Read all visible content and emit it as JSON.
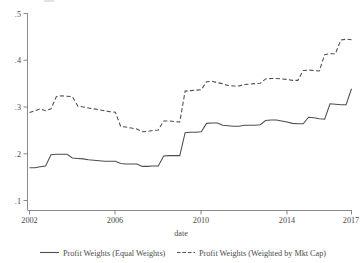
{
  "chart_data": {
    "type": "line",
    "title": "",
    "xlabel": "date",
    "ylabel": "",
    "xlim": [
      2002,
      2017
    ],
    "ylim": [
      0.1,
      0.5
    ],
    "grid": false,
    "legend_position": "bottom",
    "x_ticks": [
      "2002",
      "2006",
      "2010",
      "2014",
      "2017"
    ],
    "x_tick_values": [
      2002,
      2006,
      2010,
      2014,
      2017
    ],
    "y_ticks": [
      ".1",
      ".2",
      ".3",
      ".4",
      ".5"
    ],
    "y_tick_values": [
      0.1,
      0.2,
      0.3,
      0.4,
      0.5
    ],
    "series": [
      {
        "name": "Profit Weights (Equal Weights)",
        "style": "solid",
        "color": "#4d4d4d",
        "x": [
          2002.0,
          2002.25,
          2002.5,
          2002.75,
          2003.0,
          2003.25,
          2003.5,
          2003.75,
          2004.0,
          2004.25,
          2004.5,
          2004.75,
          2005.0,
          2005.25,
          2005.5,
          2005.75,
          2006.0,
          2006.25,
          2006.5,
          2006.75,
          2007.0,
          2007.25,
          2007.5,
          2007.75,
          2008.0,
          2008.25,
          2008.5,
          2008.75,
          2009.0,
          2009.25,
          2009.5,
          2009.75,
          2010.0,
          2010.25,
          2010.5,
          2010.75,
          2011.0,
          2011.25,
          2011.5,
          2011.75,
          2012.0,
          2012.25,
          2012.5,
          2012.75,
          2013.0,
          2013.25,
          2013.5,
          2013.75,
          2014.0,
          2014.25,
          2014.5,
          2014.75,
          2015.0,
          2015.25,
          2015.5,
          2015.75,
          2016.0,
          2016.25,
          2016.5,
          2016.75,
          2017.0
        ],
        "y": [
          0.17,
          0.17,
          0.172,
          0.174,
          0.198,
          0.199,
          0.199,
          0.199,
          0.191,
          0.19,
          0.189,
          0.187,
          0.186,
          0.185,
          0.184,
          0.184,
          0.184,
          0.179,
          0.178,
          0.178,
          0.178,
          0.173,
          0.173,
          0.174,
          0.174,
          0.195,
          0.196,
          0.196,
          0.196,
          0.245,
          0.246,
          0.246,
          0.247,
          0.265,
          0.266,
          0.266,
          0.261,
          0.26,
          0.259,
          0.259,
          0.261,
          0.261,
          0.261,
          0.262,
          0.271,
          0.272,
          0.272,
          0.27,
          0.268,
          0.265,
          0.264,
          0.264,
          0.278,
          0.277,
          0.275,
          0.274,
          0.307,
          0.306,
          0.305,
          0.305,
          0.339
        ]
      },
      {
        "name": "Profit Weights (Weighted by Mkt Cap)",
        "style": "dashed",
        "color": "#4d4d4d",
        "x": [
          2002.0,
          2002.25,
          2002.5,
          2002.75,
          2003.0,
          2003.25,
          2003.5,
          2003.75,
          2004.0,
          2004.25,
          2004.5,
          2004.75,
          2005.0,
          2005.25,
          2005.5,
          2005.75,
          2006.0,
          2006.25,
          2006.5,
          2006.75,
          2007.0,
          2007.25,
          2007.5,
          2007.75,
          2008.0,
          2008.25,
          2008.5,
          2008.75,
          2009.0,
          2009.25,
          2009.5,
          2009.75,
          2010.0,
          2010.25,
          2010.5,
          2010.75,
          2011.0,
          2011.25,
          2011.5,
          2011.75,
          2012.0,
          2012.25,
          2012.5,
          2012.75,
          2013.0,
          2013.25,
          2013.5,
          2013.75,
          2014.0,
          2014.25,
          2014.5,
          2014.75,
          2015.0,
          2015.25,
          2015.5,
          2015.75,
          2016.0,
          2016.25,
          2016.5,
          2016.75,
          2017.0
        ],
        "y": [
          0.288,
          0.292,
          0.296,
          0.292,
          0.296,
          0.322,
          0.324,
          0.323,
          0.322,
          0.302,
          0.3,
          0.298,
          0.296,
          0.294,
          0.292,
          0.29,
          0.289,
          0.258,
          0.257,
          0.255,
          0.253,
          0.247,
          0.248,
          0.25,
          0.251,
          0.27,
          0.27,
          0.269,
          0.268,
          0.334,
          0.335,
          0.336,
          0.337,
          0.354,
          0.355,
          0.352,
          0.35,
          0.346,
          0.345,
          0.345,
          0.348,
          0.349,
          0.35,
          0.351,
          0.36,
          0.361,
          0.361,
          0.36,
          0.359,
          0.357,
          0.357,
          0.378,
          0.379,
          0.378,
          0.377,
          0.412,
          0.414,
          0.414,
          0.443,
          0.445,
          0.444
        ]
      }
    ],
    "legend": [
      {
        "label": "Profit Weights (Equal Weights)",
        "style": "solid"
      },
      {
        "label": "Profit Weights (Weighted by Mkt Cap)",
        "style": "dashed"
      }
    ]
  }
}
